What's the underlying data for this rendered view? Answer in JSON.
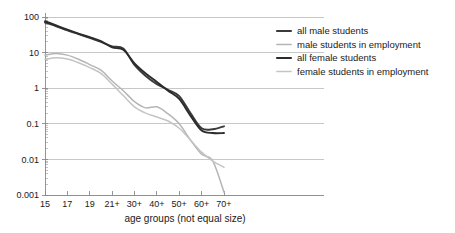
{
  "chart_data": {
    "type": "line",
    "title": "",
    "xlabel": "age groups (not equal size)",
    "ylabel": "",
    "yscale": "log",
    "ylim": [
      0.001,
      100
    ],
    "grid": true,
    "legend_position": "right",
    "categories": [
      "15",
      "16",
      "17",
      "18",
      "19",
      "20",
      "21+",
      "25+",
      "30+",
      "35+",
      "40+",
      "45+",
      "50+",
      "55+",
      "60+",
      "65+",
      "70+"
    ],
    "xticklabels": [
      "15",
      "17",
      "19",
      "21+",
      "30+",
      "40+",
      "50+",
      "60+",
      "70+"
    ],
    "yticklabels": [
      "100",
      "10",
      "1",
      "0.1",
      "0.01",
      "0.001"
    ],
    "ytickvalues": [
      100,
      10,
      1,
      0.1,
      0.01,
      0.001
    ],
    "series": [
      {
        "name": "all male students",
        "color": "#3a3a3a",
        "values": [
          70,
          55,
          42,
          33,
          26,
          20,
          15,
          13,
          4.5,
          2.2,
          1.3,
          0.9,
          0.6,
          0.2,
          0.075,
          0.07,
          0.085
        ]
      },
      {
        "name": "male students in employment",
        "color": "#b5b5b5",
        "values": [
          8.5,
          9.5,
          8.5,
          6.5,
          4.6,
          3.2,
          1.6,
          0.85,
          0.42,
          0.28,
          0.3,
          0.19,
          0.1,
          0.035,
          0.014,
          0.009,
          0.0012
        ]
      },
      {
        "name": "all female students",
        "color": "#2b2b2b",
        "values": [
          76,
          58,
          44,
          34,
          27,
          21,
          14,
          12,
          5.0,
          2.6,
          1.5,
          0.85,
          0.5,
          0.17,
          0.065,
          0.055,
          0.055
        ]
      },
      {
        "name": "female students in employment",
        "color": "#c4c4c4",
        "values": [
          6.5,
          7.2,
          6.6,
          5.2,
          3.8,
          2.6,
          1.3,
          0.62,
          0.3,
          0.2,
          0.155,
          0.12,
          0.075,
          0.035,
          0.016,
          0.009,
          0.006
        ]
      }
    ]
  },
  "legend": {
    "entries": [
      {
        "label": "all male students"
      },
      {
        "label": "male students in employment"
      },
      {
        "label": "all female students"
      },
      {
        "label": "female students in employment"
      }
    ]
  }
}
